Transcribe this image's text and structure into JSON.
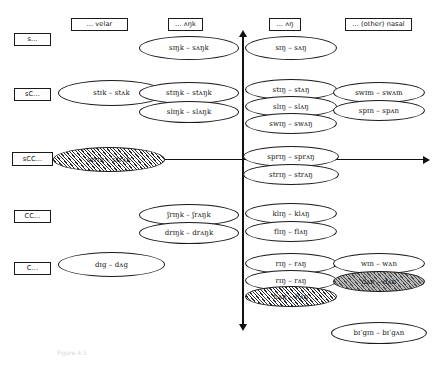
{
  "figure": {
    "caption": "Figure 4.5"
  },
  "columns": [
    {
      "id": "velar",
      "label": "... velar"
    },
    {
      "id": "ungk",
      "label": "... ʌŋk"
    },
    {
      "id": "ung",
      "label": "... ʌŋ"
    },
    {
      "id": "nasal",
      "label": "... (other) nasal"
    }
  ],
  "rows": [
    {
      "id": "s",
      "label": "s..."
    },
    {
      "id": "sC",
      "label": "sC..."
    },
    {
      "id": "sCC",
      "label": "sCC..."
    },
    {
      "id": "CC",
      "label": "CC..."
    },
    {
      "id": "C",
      "label": "C..."
    }
  ],
  "items": {
    "velar": {
      "sC": [
        {
          "text": "stɪk – stʌk",
          "style": "plain"
        }
      ],
      "sCC": [
        {
          "text": "strɪk – strʌk",
          "style": "hatched"
        }
      ],
      "C": [
        {
          "text": "dɪg – dʌg",
          "style": "plain"
        }
      ]
    },
    "ungk": {
      "s": [
        {
          "text": "sɪŋk – sʌŋk",
          "style": "plain"
        }
      ],
      "sC": [
        {
          "text": "stɪŋk – stʌŋk",
          "style": "plain"
        },
        {
          "text": "slɪŋk – slʌŋk",
          "style": "plain"
        }
      ],
      "CC": [
        {
          "text": "ʃrɪŋk – ʃrʌŋk",
          "style": "plain"
        },
        {
          "text": "drɪŋk – drʌŋk",
          "style": "plain"
        }
      ]
    },
    "ung": {
      "s": [
        {
          "text": "sɪŋ – sʌŋ",
          "style": "plain"
        }
      ],
      "sC": [
        {
          "text": "stɪŋ – stʌŋ",
          "style": "plain"
        },
        {
          "text": "slɪŋ – slʌŋ",
          "style": "plain"
        },
        {
          "text": "swɪŋ – swʌŋ",
          "style": "plain"
        }
      ],
      "sCC": [
        {
          "text": "sprɪŋ – sprʌŋ",
          "style": "plain"
        },
        {
          "text": "strɪŋ – strʌŋ",
          "style": "plain"
        }
      ],
      "CC": [
        {
          "text": "klɪŋ – klʌŋ",
          "style": "plain"
        },
        {
          "text": "flɪŋ – flʌŋ",
          "style": "plain"
        }
      ],
      "C": [
        {
          "text": "rɪŋ – rʌŋ",
          "style": "plain"
        },
        {
          "text": "rɪŋ – rʌŋ",
          "style": "plain"
        },
        {
          "text": "hʌŋ – hʌŋ",
          "style": "hatched"
        }
      ]
    },
    "nasal": {
      "sC": [
        {
          "text": "swɪm – swʌm",
          "style": "plain"
        },
        {
          "text": "spɪn – spʌn",
          "style": "plain"
        }
      ],
      "C": [
        {
          "text": "wɪn – wʌn",
          "style": "plain"
        },
        {
          "text": "dʌn – dʌn",
          "style": "shaded"
        }
      ],
      "extra": [
        {
          "text": "bɪˈgɪn – bɪˈgʌn",
          "style": "plain"
        }
      ]
    }
  }
}
